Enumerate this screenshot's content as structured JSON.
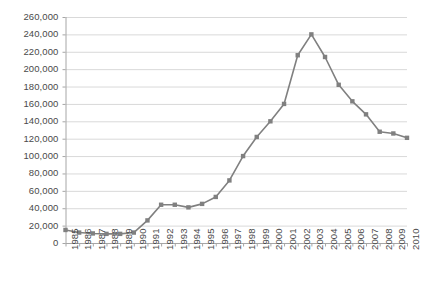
{
  "chart_data": {
    "type": "line",
    "title": "",
    "subtitle": "",
    "xlabel": "",
    "ylabel": "",
    "categories": [
      "1985",
      "1986",
      "1987",
      "1988",
      "1989",
      "1990",
      "1991",
      "1992",
      "1993",
      "1994",
      "1995",
      "1996",
      "1997",
      "1998",
      "1999",
      "2000",
      "2001",
      "2002",
      "2003",
      "2004",
      "2005",
      "2006",
      "2007",
      "2008",
      "2009",
      "2010"
    ],
    "values": [
      15000,
      12000,
      11000,
      10500,
      10500,
      12000,
      26000,
      44000,
      44000,
      41000,
      45000,
      53000,
      72000,
      100000,
      122000,
      140000,
      160000,
      216000,
      240000,
      214000,
      182000,
      163000,
      148000,
      128000,
      126000,
      121000
    ],
    "ylim": [
      0,
      260000
    ],
    "ytick_step": 20000,
    "ytick_labels": [
      "0",
      "20,000",
      "40,000",
      "60,000",
      "80,000",
      "100,000",
      "120,000",
      "140,000",
      "160,000",
      "180,000",
      "200,000",
      "220,000",
      "240,000",
      "260,000"
    ],
    "grid": true,
    "grid_axis": "y",
    "legend": false,
    "legend_position": "none",
    "marker": "square",
    "series_color": "#808080",
    "grid_color": "#d9d9d9",
    "axis_color": "#a6a6a6",
    "text_color": "#4a4a4a",
    "background": "#ffffff"
  }
}
